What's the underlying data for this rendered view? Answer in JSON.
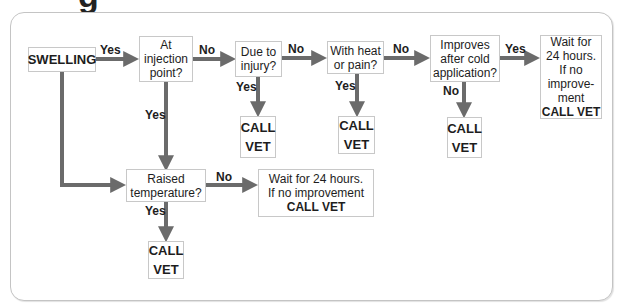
{
  "title_partial": "g",
  "colors": {
    "arrow": "#6b6b6b",
    "box_border": "#c8c8c8",
    "panel_border": "#c4c4c4",
    "text": "#1d1d1d"
  },
  "nodes": {
    "swelling": "SWELLING",
    "injection_point": [
      "At",
      "injection",
      "point?"
    ],
    "due_to_injury": [
      "Due to",
      "injury?"
    ],
    "heat_or_pain": [
      "With heat",
      "or pain?"
    ],
    "cold_application": [
      "Improves",
      "after cold",
      "application?"
    ],
    "wait_right": [
      "Wait for",
      "24 hours.",
      "If no",
      "improve-",
      "ment"
    ],
    "wait_right_action": "CALL VET",
    "raised_temperature": [
      "Raised",
      "temperature?"
    ],
    "wait_bottom": [
      "Wait for 24 hours.",
      "If no improvement"
    ],
    "wait_bottom_action": "CALL VET",
    "call_vet": [
      "CALL",
      "VET"
    ]
  },
  "edges": {
    "swelling_to_injection": "Yes",
    "injection_to_injury": "No",
    "injury_to_heat": "No",
    "heat_to_cold": "No",
    "cold_to_wait": "Yes",
    "injury_to_callvet": "Yes",
    "heat_to_callvet": "Yes",
    "cold_to_callvet": "No",
    "injection_to_temperature": "Yes",
    "temperature_to_wait": "No",
    "temperature_to_callvet": "Yes"
  }
}
